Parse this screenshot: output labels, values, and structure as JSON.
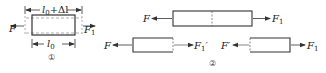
{
  "diagram1": {
    "number": "①",
    "top_dimension": {
      "base": "l",
      "sub": "0",
      "suffix": "+Δl"
    },
    "bottom_dimension": {
      "base": "l",
      "sub": "0"
    },
    "left_force": "F",
    "right_force": {
      "base": "F",
      "sub": "1"
    }
  },
  "diagram2": {
    "number": "②",
    "top_bar": {
      "left_force": "F",
      "right_force": {
        "base": "F",
        "sub": "1"
      }
    },
    "bottom_left": {
      "left_force": "F",
      "right_force": {
        "base": "F",
        "sub": "1",
        "prime": "′"
      }
    },
    "bottom_right": {
      "left_force": "F′",
      "right_force": {
        "base": "F",
        "sub": "1"
      }
    }
  },
  "colors": {
    "line": "#333333",
    "dashed": "#999999"
  }
}
